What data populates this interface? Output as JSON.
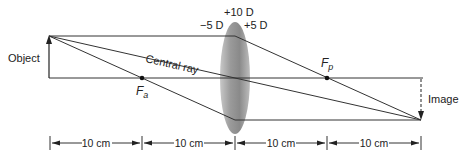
{
  "labels": {
    "object": "Object",
    "image": "Image",
    "central_ray": "Central ray",
    "focal_anterior_main": "F",
    "focal_anterior_sub": "a",
    "focal_posterior_main": "F",
    "focal_posterior_sub": "p",
    "lens_total_power": "+10 D",
    "lens_front_power": "−5 D",
    "lens_back_power": "+5 D"
  },
  "dimensions": [
    {
      "label": "10 cm"
    },
    {
      "label": "10 cm"
    },
    {
      "label": "10 cm"
    },
    {
      "label": "10 cm"
    }
  ],
  "colors": {
    "line": "#333333",
    "lens_dark": "#7a7a7a",
    "lens_light": "#d0d0d0"
  }
}
